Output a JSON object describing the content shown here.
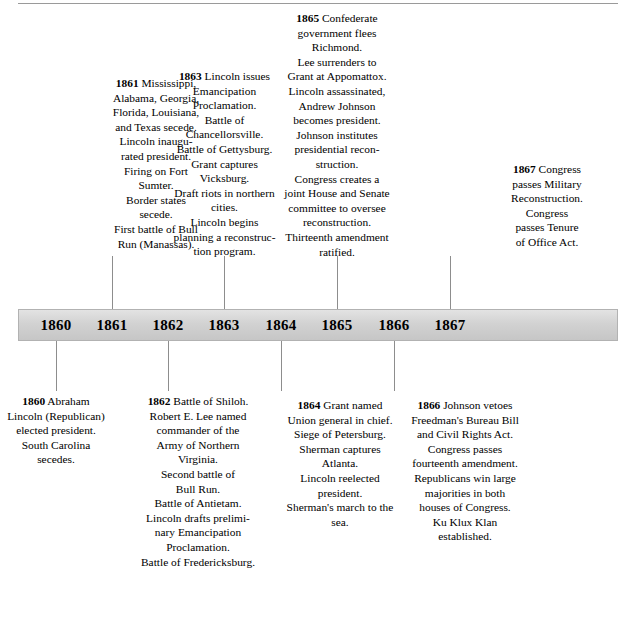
{
  "timeline": {
    "title": "Civil War and Reconstruction Timeline",
    "axis_years": [
      "1860",
      "1861",
      "1862",
      "1863",
      "1864",
      "1865",
      "1866",
      "1867"
    ],
    "above_entries": [
      {
        "year": "1861",
        "lines": [
          "Mississippi,",
          "Alabama, Georgia,",
          "Florida, Louisiana,",
          "and Texas secede.",
          "Lincoln inaugu-",
          "rated president.",
          "Firing on Fort",
          "Sumter.",
          "Border states",
          "secede.",
          "First battle of Bull",
          "Run (Manassas)."
        ]
      },
      {
        "year": "1863",
        "lines": [
          "Lincoln issues",
          "Emancipation",
          "Proclamation.",
          "Battle of",
          "Chancellorsville.",
          "Battle of Gettysburg.",
          "Grant captures",
          "Vicksburg.",
          "Draft riots in northern",
          "cities.",
          "Lincoln begins",
          "planning a reconstruc-",
          "tion program."
        ]
      },
      {
        "year": "1865",
        "lines": [
          "Confederate",
          "government flees",
          "Richmond.",
          "Lee surrenders to",
          "Grant at Appomattox.",
          "Lincoln assassinated,",
          "Andrew Johnson",
          "becomes president.",
          "Johnson institutes",
          "presidential recon-",
          "struction.",
          "Congress creates a",
          "joint House and Senate",
          "committee to oversee",
          "reconstruction.",
          "Thirteenth amendment",
          "ratified."
        ]
      },
      {
        "year": "1867",
        "lines": [
          "Congress",
          "passes Military",
          "Reconstruction.",
          "Congress",
          "passes Tenure",
          "of Office Act."
        ]
      }
    ],
    "below_entries": [
      {
        "year": "1860",
        "lines": [
          "Abraham",
          "Lincoln (Republican)",
          "elected president.",
          "South Carolina",
          "secedes."
        ]
      },
      {
        "year": "1862",
        "lines": [
          "Battle of Shiloh.",
          "Robert E. Lee named",
          "commander of the",
          "Army of Northern",
          "Virginia.",
          "Second battle of",
          "Bull Run.",
          "Battle of Antietam.",
          "Lincoln drafts prelimi-",
          "nary Emancipation",
          "Proclamation.",
          "Battle of Fredericksburg."
        ]
      },
      {
        "year": "1864",
        "lines": [
          "Grant named",
          "Union general in chief.",
          "Siege of Petersburg.",
          "Sherman captures",
          "Atlanta.",
          "Lincoln reelected",
          "president.",
          "Sherman's march to the",
          "sea."
        ]
      },
      {
        "year": "1866",
        "lines": [
          "Johnson vetoes",
          "Freedman's Bureau Bill",
          "and Civil Rights Act.",
          "Congress passes",
          "fourteenth amendment.",
          "Republicans win large",
          "majorities in both",
          "houses of Congress.",
          "Ku Klux Klan",
          "established."
        ]
      }
    ],
    "colors": {
      "bar_fill": "#d6d6d6",
      "bar_border": "#b2b2b2",
      "leader_line": "#8d8d8d",
      "text": "#000000",
      "background": "#ffffff"
    }
  }
}
